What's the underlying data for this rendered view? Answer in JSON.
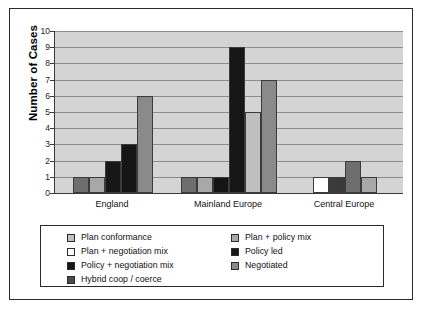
{
  "chart_data": {
    "type": "bar",
    "title": "",
    "xlabel": "",
    "ylabel": "Number of Cases",
    "ylim": [
      0,
      10
    ],
    "yticks": [
      10,
      9,
      8,
      7,
      6,
      5,
      4,
      3,
      2,
      1,
      0
    ],
    "grid": true,
    "legend_position": "bottom",
    "categories": [
      "England",
      "Mainland Europe",
      "Central Europe"
    ],
    "series": [
      {
        "name": "Plan conformance",
        "color": "#bfbfbf",
        "values": [
          0,
          5,
          0
        ]
      },
      {
        "name": "Plan + negotiation mix",
        "color": "#ffffff",
        "values": [
          0,
          0,
          1
        ]
      },
      {
        "name": "Policy + negotiation mix",
        "color": "#151515",
        "values": [
          3,
          0,
          0
        ]
      },
      {
        "name": "Hybrid coop / coerce",
        "color": "#6e6e6e",
        "values": [
          1,
          1,
          1
        ]
      },
      {
        "name": "Plan + policy mix",
        "color": "#a8a8a8",
        "values": [
          1,
          1,
          0
        ]
      },
      {
        "name": "Policy led",
        "color": "#171717",
        "values": [
          2,
          9,
          0
        ]
      },
      {
        "name": "Negotiated",
        "color": "#8a8a8a",
        "values": [
          6,
          7,
          2
        ]
      }
    ],
    "bars": [
      {
        "group": "England",
        "series": "Hybrid coop / coerce",
        "value": 1,
        "color": "#6e6e6e"
      },
      {
        "group": "England",
        "series": "Plan + policy mix",
        "value": 1,
        "color": "#a8a8a8"
      },
      {
        "group": "England",
        "series": "Policy led",
        "value": 2,
        "color": "#171717"
      },
      {
        "group": "England",
        "series": "Policy + negotiation mix",
        "value": 3,
        "color": "#151515"
      },
      {
        "group": "England",
        "series": "Negotiated",
        "value": 6,
        "color": "#8a8a8a"
      },
      {
        "group": "Mainland Europe",
        "series": "Hybrid coop / coerce",
        "value": 1,
        "color": "#6e6e6e"
      },
      {
        "group": "Mainland Europe",
        "series": "Plan + policy mix",
        "value": 1,
        "color": "#a8a8a8"
      },
      {
        "group": "Mainland Europe",
        "series": "Policy + negotiation mix",
        "value": 1,
        "color": "#151515"
      },
      {
        "group": "Mainland Europe",
        "series": "Policy led",
        "value": 9,
        "color": "#171717"
      },
      {
        "group": "Mainland Europe",
        "series": "Plan conformance",
        "value": 5,
        "color": "#bfbfbf"
      },
      {
        "group": "Mainland Europe",
        "series": "Negotiated",
        "value": 7,
        "color": "#8a8a8a"
      },
      {
        "group": "Central Europe",
        "series": "Plan + negotiation mix",
        "value": 1,
        "color": "#ffffff"
      },
      {
        "group": "Central Europe",
        "series": "Policy led",
        "value": 1,
        "color": "#3a3a3a"
      },
      {
        "group": "Central Europe",
        "series": "Negotiated",
        "value": 2,
        "color": "#6e6e6e"
      },
      {
        "group": "Central Europe",
        "series": "Plan + policy mix",
        "value": 1,
        "color": "#a8a8a8"
      }
    ]
  },
  "axis": {
    "y_title": "Number of Cases",
    "y_ticks": [
      "10",
      "9",
      "8",
      "7",
      "6",
      "5",
      "4",
      "3",
      "2",
      "1",
      "0"
    ],
    "x_categories": [
      "England",
      "Mainland Europe",
      "Central Europe"
    ]
  },
  "legend": {
    "left_column": [
      {
        "label": "Plan conformance",
        "color": "#bfbfbf"
      },
      {
        "label": "Plan + negotiation mix",
        "color": "#ffffff"
      },
      {
        "label": "Policy + negotiation mix",
        "color": "#151515"
      },
      {
        "label": "Hybrid coop / coerce",
        "color": "#4a4a4a"
      }
    ],
    "right_column": [
      {
        "label": "Plan + policy mix",
        "color": "#a8a8a8"
      },
      {
        "label": "Policy led",
        "color": "#171717"
      },
      {
        "label": "Negotiated",
        "color": "#8a8a8a"
      }
    ]
  },
  "colors": {
    "plot_background": "#d4d4d4",
    "gridline": "#8d8d8d",
    "axis": "#3a3a3a",
    "frame": "#2b2b2b",
    "page_background": "#ffffff"
  }
}
